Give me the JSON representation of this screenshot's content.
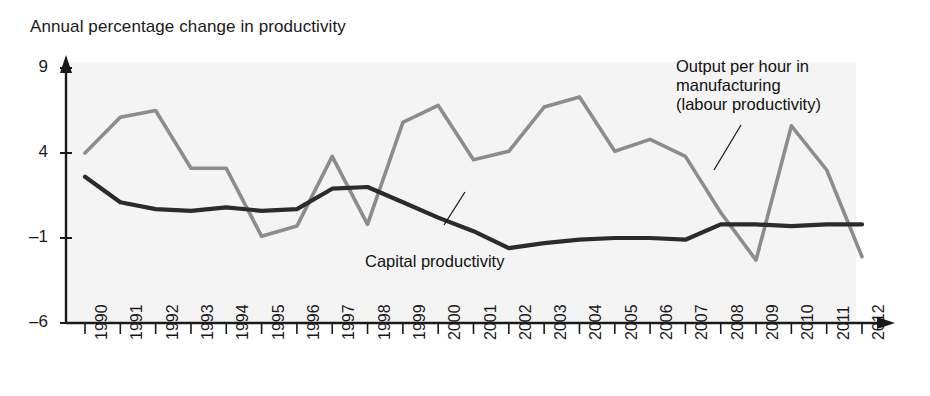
{
  "chart_data": {
    "type": "line",
    "title": "Annual percentage change in productivity",
    "xlabel": "",
    "ylabel": "",
    "ylim": [
      -6,
      9
    ],
    "yticks": [
      9,
      4,
      -1,
      -6
    ],
    "ytick_labels": [
      "9",
      "4",
      "–1",
      "–6"
    ],
    "grid": false,
    "legend_position": "inline-annotations",
    "x": [
      1990,
      1991,
      1992,
      1993,
      1994,
      1995,
      1996,
      1997,
      1998,
      1999,
      2000,
      2001,
      2002,
      2003,
      2004,
      2005,
      2006,
      2007,
      2008,
      2009,
      2010,
      2011,
      2012
    ],
    "xtick_labels": [
      "1990",
      "1991",
      "1992",
      "1993",
      "1994",
      "1995",
      "1996",
      "1997",
      "1998",
      "1999",
      "2000",
      "2001",
      "2002",
      "2003",
      "2004",
      "2005",
      "2006",
      "2007",
      "2008",
      "2009",
      "2010",
      "2011",
      "2012"
    ],
    "series": [
      {
        "name": "Output per hour in manufacturing (labour productivity)",
        "color": "#8c8c8c",
        "values": [
          4.0,
          6.1,
          6.5,
          3.1,
          3.1,
          -0.9,
          -0.3,
          3.8,
          -0.2,
          5.8,
          6.8,
          3.6,
          4.1,
          6.7,
          7.3,
          4.1,
          4.8,
          3.8,
          0.5,
          -2.3,
          5.6,
          3.0,
          -2.1
        ]
      },
      {
        "name": "Capital productivity",
        "color": "#2b2b2b",
        "values": [
          2.6,
          1.1,
          0.7,
          0.6,
          0.8,
          0.6,
          0.7,
          1.9,
          2.0,
          1.1,
          0.2,
          -0.6,
          -1.6,
          -1.3,
          -1.1,
          -1.0,
          -1.0,
          -1.1,
          -0.2,
          -0.2,
          -0.3,
          -0.2,
          -0.2
        ]
      }
    ],
    "annotations": [
      {
        "id": "labour-productivity-annotation",
        "text": "Output per hour in\nmanufacturing\n(labour productivity)",
        "target_year": 2008
      },
      {
        "id": "capital-productivity-annotation",
        "text": "Capital productivity",
        "target_year": 2000
      }
    ]
  },
  "axes": {
    "y_arrow": "up-arrow",
    "x_arrow": "right-arrow"
  }
}
